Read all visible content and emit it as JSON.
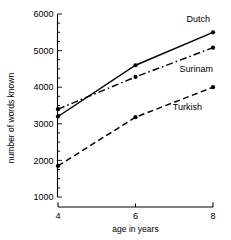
{
  "chart_data": {
    "type": "line",
    "title": "",
    "xlabel": "age in years",
    "ylabel": "number of words known",
    "x": [
      4,
      6,
      8
    ],
    "xticks": [
      "4",
      "6",
      "8"
    ],
    "xlim": [
      4,
      8
    ],
    "ylim": [
      1000,
      6000
    ],
    "yticks": [
      "1000",
      "2000",
      "3000",
      "4000",
      "5000",
      "6000"
    ],
    "ytick_values": [
      1000,
      2000,
      3000,
      4000,
      5000,
      6000
    ],
    "yminor_step": 250,
    "grid": false,
    "legend_position": "inline-right-labels",
    "series": [
      {
        "name": "Dutch",
        "style": "solid",
        "marker": "filled-circle",
        "color": "#000000",
        "values": [
          3200,
          4600,
          5500
        ]
      },
      {
        "name": "Surinam",
        "style": "dash-dot",
        "marker": "filled-circle",
        "color": "#000000",
        "values": [
          3400,
          4280,
          5080
        ]
      },
      {
        "name": "Turkish",
        "style": "dashed",
        "marker": "filled-circle",
        "color": "#000000",
        "values": [
          1850,
          3180,
          4000
        ]
      }
    ],
    "annotations": [
      {
        "text": "Dutch",
        "near": "top-right"
      },
      {
        "text": "Surinam",
        "near": "middle-right"
      },
      {
        "text": "Turkish",
        "near": "lower-right"
      }
    ]
  }
}
